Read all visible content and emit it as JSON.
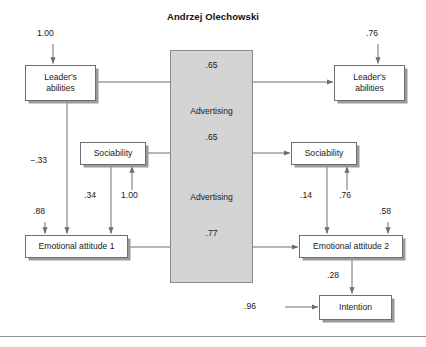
{
  "figure": {
    "title": "Andrzej Olechowski",
    "center_panel": {
      "label_top_coefficient": ".65",
      "label_upper_name": "Advertising",
      "label_middle_coefficient": ".65",
      "label_lower_name": "Advertising",
      "label_bottom_coefficient": ".77",
      "fill_color": "#d4d4d4",
      "border_color": "#8a8a8a"
    },
    "nodes": [
      {
        "id": "leader-abilities-left",
        "line1": "Leader's",
        "line2": "abilities"
      },
      {
        "id": "leader-abilities-right",
        "line1": "Leader's",
        "line2": "abilities"
      },
      {
        "id": "sociability-left",
        "line1": "Sociability",
        "line2": ""
      },
      {
        "id": "sociability-right",
        "line1": "Sociability",
        "line2": ""
      },
      {
        "id": "emotional-attitude-1",
        "line1": "Emotional attitude 1",
        "line2": ""
      },
      {
        "id": "emotional-attitude-2",
        "line1": "Emotional attitude 2",
        "line2": ""
      },
      {
        "id": "intention",
        "line1": "Intention",
        "line2": ""
      }
    ],
    "coefficients": {
      "leader_left_error": "1.00",
      "leader_right_error": ".76",
      "leader_to_emotional1": "−.33",
      "emotional1_error": ".88",
      "sociability_left_to_emotional1": ".34",
      "sociability_left_error": "1.00",
      "sociability_right_to_emotional2": ".14",
      "sociability_right_error": ".76",
      "emotional2_error": ".58",
      "emotional2_to_intention": ".28",
      "intention_error": ".96"
    },
    "colors": {
      "box_border": "#6e6e6e",
      "box_shadow": "#9a9a9a",
      "arrow": "#6e6e6e",
      "text": "#1a1a1a"
    }
  }
}
